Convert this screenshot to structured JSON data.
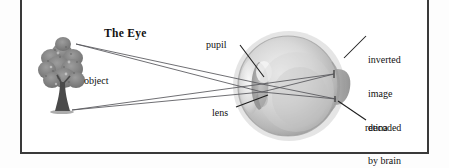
{
  "figure": {
    "title": "The Eye",
    "kind": "labeled anatomical diagram",
    "frame_color": "#3a3a3a",
    "background_color": "#ffffff",
    "ink_color": "#111111"
  },
  "labels": {
    "object": "object",
    "pupil": "pupil",
    "lens": "lens",
    "retina": "retina",
    "inverted_line1": "inverted",
    "inverted_line2": "image",
    "inverted_line3": "decoded",
    "inverted_line4": "by brain"
  },
  "illustration": {
    "tree_name": "tree-object-illustration",
    "eyeball_name": "eyeball-illustration",
    "ray_count": 4,
    "eye_fill_light": "#e9e9e9",
    "eye_fill_mid": "#c9c9c9",
    "eye_fill_dark": "#9a9a9a",
    "tree_canopy_color": "#8d8d8d",
    "tree_trunk_color": "#4a4a4a",
    "ray_color": "#55555a"
  }
}
